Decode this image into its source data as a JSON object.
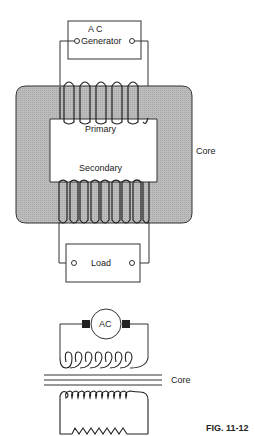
{
  "figure_label": "FIG. 11-12",
  "top_diagram": {
    "generator_label_line1": "A C",
    "generator_label_line2": "Generator",
    "primary_label": "Primary",
    "secondary_label": "Secondary",
    "core_label": "Core",
    "load_label": "Load",
    "primary_turns": 5,
    "secondary_turns": 8,
    "core_color": "#bdbdbd"
  },
  "schematic": {
    "source_label": "AC",
    "core_label": "Core",
    "primary_loops": 7,
    "secondary_loops": 10,
    "load_zigzags": 7
  }
}
